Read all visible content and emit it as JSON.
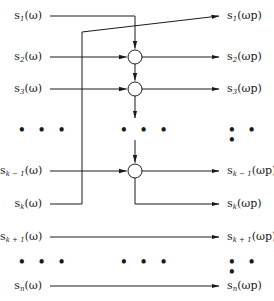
{
  "diagram": {
    "inputs": [
      {
        "id": "s1",
        "base": "s",
        "sub": "1",
        "arg": "(ω)",
        "y": 16
      },
      {
        "id": "s2",
        "base": "s",
        "sub": "2",
        "arg": "(ω)",
        "y": 57
      },
      {
        "id": "s3",
        "base": "s",
        "sub": "3",
        "arg": "(ω)",
        "y": 89
      },
      {
        "id": "sk-1",
        "base": "s",
        "sub": "k − 1",
        "arg": "(ω)",
        "y": 171
      },
      {
        "id": "sk",
        "base": "s",
        "sub": "k",
        "arg": "(ω)",
        "y": 204
      },
      {
        "id": "sk+1",
        "base": "s",
        "sub": "k + 1",
        "arg": "(ω)",
        "y": 237
      },
      {
        "id": "sn",
        "base": "s",
        "sub": "n",
        "arg": "(ω)",
        "y": 286
      }
    ],
    "outputs": [
      {
        "id": "s1p",
        "base": "s",
        "sub": "1",
        "arg": "(ωp)",
        "y": 16
      },
      {
        "id": "s2p",
        "base": "s",
        "sub": "2",
        "arg": "(ωp)",
        "y": 57
      },
      {
        "id": "s3p",
        "base": "s",
        "sub": "3",
        "arg": "(ωp)",
        "y": 89
      },
      {
        "id": "sk-1p",
        "base": "s",
        "sub": "k − 1",
        "arg": "(ωp)",
        "y": 171
      },
      {
        "id": "skp",
        "base": "s",
        "sub": "k",
        "arg": "(ωp)",
        "y": 204
      },
      {
        "id": "sk+1p",
        "base": "s",
        "sub": "k + 1",
        "arg": "(ωp)",
        "y": 237
      },
      {
        "id": "snp",
        "base": "s",
        "sub": "n",
        "arg": "(ωp)",
        "y": 286
      }
    ],
    "ellipsis": "• • •",
    "nodes": [
      {
        "id": "node-2",
        "cx": 135,
        "cy": 57,
        "r": 7
      },
      {
        "id": "node-3",
        "cx": 135,
        "cy": 89,
        "r": 7
      },
      {
        "id": "node-k-1",
        "cx": 135,
        "cy": 171,
        "r": 7
      }
    ],
    "colors": {
      "line": "#1a1a1a",
      "background": "#ffffff"
    }
  }
}
